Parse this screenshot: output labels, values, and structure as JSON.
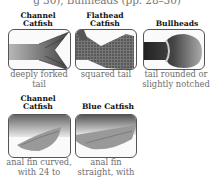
{
  "header": {
    "text": "g 30), Bullheads (pp. 28–30)"
  },
  "row1": [
    {
      "title_line1": "Channel",
      "title_line2": "Catfish",
      "caption_line1": "deeply forked",
      "caption_line2": "tail",
      "icon": "forked-tail-illustration"
    },
    {
      "title_line1": "Flathead",
      "title_line2": "Catfish",
      "caption_line1": "squared tail",
      "caption_line2": "",
      "icon": "squared-tail-illustration"
    },
    {
      "title_line1": "",
      "title_line2": "Bullheads",
      "caption_line1": "tail rounded or",
      "caption_line2": "slightly notched",
      "icon": "rounded-tail-illustration"
    }
  ],
  "row2": [
    {
      "title_line1": "Channel",
      "title_line2": "Catfish",
      "caption_line1": "anal fin curved,",
      "caption_line2": "with 24 to",
      "icon": "curved-anal-fin-illustration"
    },
    {
      "title_line1": "",
      "title_line2": "Blue Catfish",
      "caption_line1": "anal fin",
      "caption_line2": "straight, with",
      "icon": "straight-anal-fin-illustration"
    }
  ]
}
